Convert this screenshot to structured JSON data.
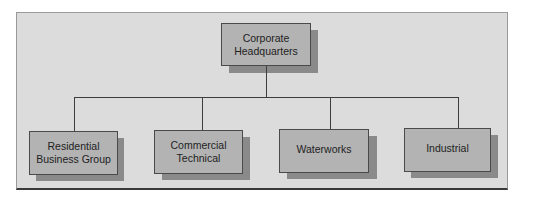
{
  "diagram": {
    "type": "org-chart",
    "root": {
      "label": "Corporate\nHeadquarters"
    },
    "children": [
      {
        "label": "Residential\nBusiness Group"
      },
      {
        "label": "Commercial\nTechnical"
      },
      {
        "label": "Waterworks"
      },
      {
        "label": "Industrial"
      }
    ]
  },
  "colors": {
    "panel_background": "#dcdcdc",
    "node_fill": "#b3b3b3",
    "node_shadow": "#8a8a8a",
    "node_border": "#4a4a4a",
    "connector": "#3d3d3d",
    "text": "#222222"
  }
}
